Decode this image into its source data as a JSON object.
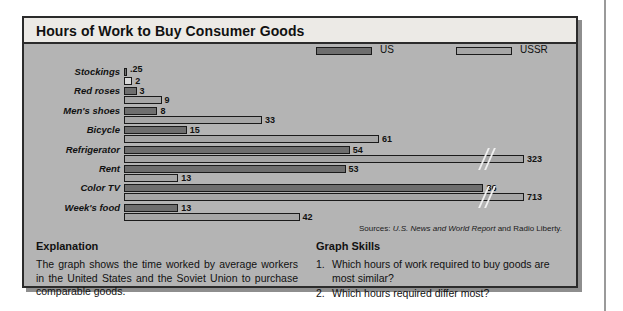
{
  "figure": {
    "title": "Hours of Work to Buy Consumer Goods",
    "sources_prefix": "Sources:",
    "sources_italic": "U.S. News and World Report",
    "sources_suffix": "and Radio Liberty."
  },
  "legend": {
    "position": "top-right",
    "entries": [
      {
        "label": "US",
        "color": "#6e6e6e",
        "swatch": "legend-swatch-us"
      },
      {
        "label": "USSR",
        "color": "#a6a6a6",
        "swatch": "legend-swatch-ussr"
      }
    ]
  },
  "explanation": {
    "heading": "Explanation",
    "body": "The graph shows the time worked by average workers in the United States and the Soviet Union to purchase comparable goods."
  },
  "graph_skills": {
    "heading": "Graph Skills",
    "questions": [
      {
        "num": "1.",
        "text": "Which hours of work required to buy goods are most similar?"
      },
      {
        "num": "2.",
        "text": "Which hours required differ most?"
      }
    ]
  },
  "chart_data": {
    "type": "bar",
    "orientation": "horizontal",
    "title": "Hours of Work to Buy Consumer Goods",
    "xlabel": "",
    "ylabel": "",
    "grid": false,
    "axis_break": true,
    "categories": [
      "Stockings",
      "Red roses",
      "Men's shoes",
      "Bicycle",
      "Refrigerator",
      "Rent",
      "Color TV",
      "Week's food"
    ],
    "series": [
      {
        "name": "US",
        "color": "#6e6e6e",
        "values": [
          0.25,
          3,
          8,
          15,
          54,
          53,
          86,
          13
        ],
        "labels": [
          ".25",
          "3",
          "8",
          "15",
          "54",
          "53",
          "86",
          "13"
        ],
        "broken": [
          false,
          false,
          false,
          false,
          false,
          false,
          false,
          false
        ]
      },
      {
        "name": "USSR",
        "color": "#a6a6a6",
        "values": [
          2,
          9,
          33,
          61,
          323,
          13,
          713,
          42
        ],
        "labels": [
          "2",
          "9",
          "33",
          "61",
          "323",
          "13",
          "713",
          "42"
        ],
        "broken": [
          false,
          false,
          false,
          false,
          true,
          false,
          true,
          false
        ]
      }
    ],
    "units": "hours of work"
  }
}
